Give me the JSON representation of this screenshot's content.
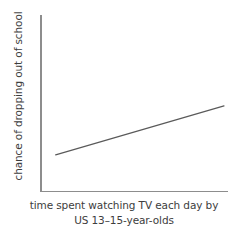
{
  "chart_data": {
    "type": "line",
    "title": "",
    "subtitle": "",
    "xlabel": "time spent watching TV each day by US 13–15-year-olds",
    "xlabel_lines": [
      "time spent watching TV each day by",
      "US 13–15-year-olds"
    ],
    "ylabel": "chance of dropping out of school",
    "xtick_labels": [],
    "ytick_labels": [],
    "grid": false,
    "legend": null,
    "annotations": [],
    "axis_ranges": {
      "xlim": [
        0,
        1
      ],
      "ylim": [
        0,
        1
      ]
    },
    "series": [
      {
        "name": "trend",
        "x": [
          0.085,
          1.0
        ],
        "y": [
          0.205,
          0.484
        ],
        "style": "solid straight increasing line",
        "color": "#5a5a5a"
      }
    ]
  },
  "colors": {
    "background": "#ffffff",
    "axis": "#8d8d8d",
    "line": "#5a5a5a",
    "text": "#3d3d3d"
  }
}
